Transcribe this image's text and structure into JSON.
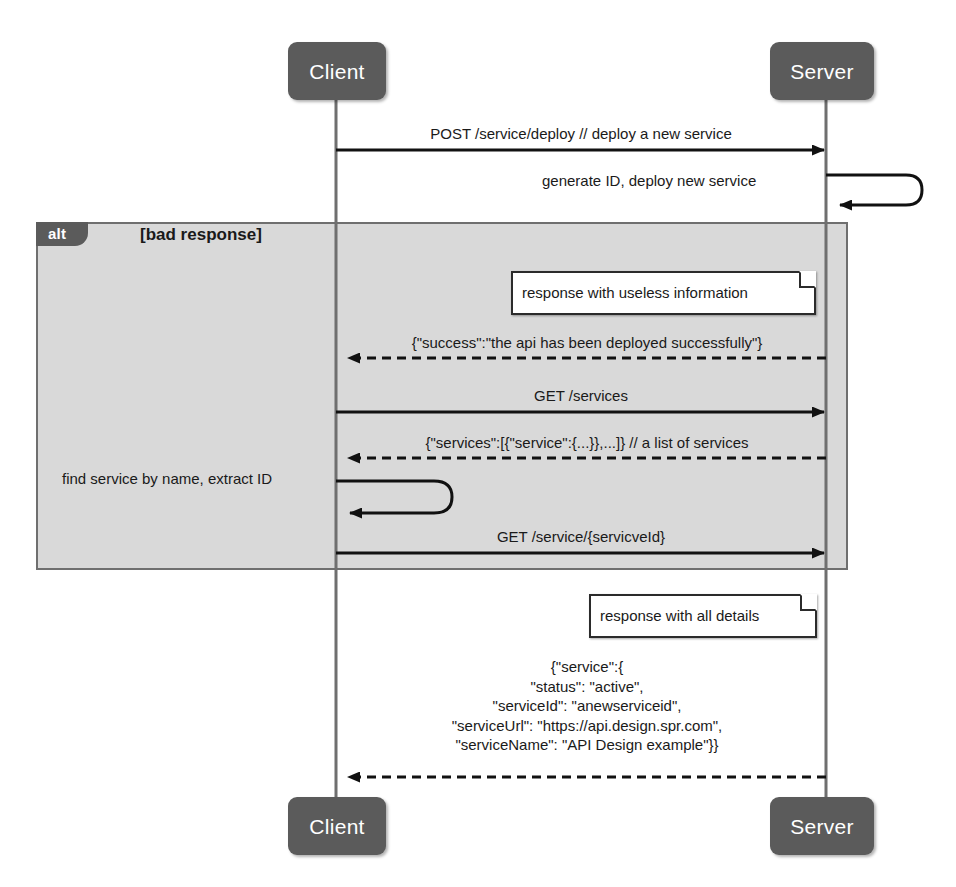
{
  "diagram": {
    "type": "uml-sequence-diagram",
    "colors": {
      "actor_fill": "#5b5b5b",
      "actor_text": "#ffffff",
      "fragment_fill": "#d9d9d9",
      "fragment_border": "#6f6f6f",
      "line": "#1a1a1a",
      "note_fill": "#ffffff",
      "note_border": "#2b2b2b",
      "background": "#ffffff"
    }
  },
  "lifelines": [
    {
      "id": "client",
      "name": "Client",
      "x": 336
    },
    {
      "id": "server",
      "name": "Server",
      "x": 826
    }
  ],
  "heads": [
    {
      "label": "Client"
    },
    {
      "label": "Server"
    }
  ],
  "feet": [
    {
      "label": "Client"
    },
    {
      "label": "Server"
    }
  ],
  "fragment": {
    "operator": "alt",
    "guard": "[bad response]"
  },
  "messages": [
    {
      "id": "m1",
      "label": "POST /service/deploy // deploy a new service",
      "from": "client",
      "to": "server",
      "kind": "sync",
      "style": "solid"
    },
    {
      "id": "m2",
      "label": "generate ID, deploy new service",
      "from": "server",
      "to": "server",
      "kind": "self",
      "style": "solid"
    },
    {
      "id": "m3",
      "label": "{\"success\":\"the api has been deployed successfully\"}",
      "from": "server",
      "to": "client",
      "kind": "return",
      "style": "dashed"
    },
    {
      "id": "m4",
      "label": "GET /services",
      "from": "client",
      "to": "server",
      "kind": "sync",
      "style": "solid"
    },
    {
      "id": "m5",
      "label": "{\"services\":[{\"service\":{...}},...]} // a list of services",
      "from": "server",
      "to": "client",
      "kind": "return",
      "style": "dashed"
    },
    {
      "id": "m6",
      "label": "find service by name, extract ID",
      "from": "client",
      "to": "client",
      "kind": "self",
      "style": "solid"
    },
    {
      "id": "m7",
      "label": "GET /service/{servicveId}",
      "from": "client",
      "to": "server",
      "kind": "sync",
      "style": "solid"
    },
    {
      "id": "m8",
      "label": "{\"service\":{\n\"status\": \"active\",\n\"serviceId\": \"anewserviceid\",\n\"serviceUrl\": \"https://api.design.spr.com\",\n\"serviceName\": \"API Design example\"}}",
      "from": "server",
      "to": "client",
      "kind": "return",
      "style": "dashed"
    }
  ],
  "notes": [
    {
      "id": "n1",
      "text": "response with useless information",
      "attached_to": "m3"
    },
    {
      "id": "n2",
      "text": "response with all details",
      "attached_to": "m8"
    }
  ]
}
